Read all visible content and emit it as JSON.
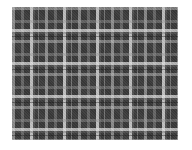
{
  "image": {
    "subject": "plaid-tartan-fabric-swatch",
    "colors": {
      "base": "#3a3a3a",
      "medium_gray": "#969696",
      "light_gray": "#c8c8c8",
      "white_stripe": "#ebebeb",
      "background": "#ffffff"
    },
    "pattern": {
      "type": "tartan",
      "repeat_px": 33
    }
  }
}
